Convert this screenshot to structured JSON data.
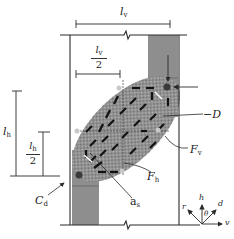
{
  "diagram": {
    "type": "beam-column joint free body / strut model",
    "labels": {
      "lv": {
        "main": "l",
        "sub": "v"
      },
      "lv_half": {
        "num_main": "l",
        "num_sub": "v",
        "den": "2"
      },
      "lh": {
        "main": "l",
        "sub": "h"
      },
      "lh_half": {
        "num_main": "l",
        "num_sub": "h",
        "den": "2"
      },
      "D": "−D",
      "Fv": {
        "main": "F",
        "sub": "v"
      },
      "Fh": {
        "main": "F",
        "sub": "h"
      },
      "Cd": {
        "main": "C",
        "sub": "d"
      },
      "as": {
        "main": "a",
        "sub": "s"
      }
    },
    "axes": {
      "h": "h",
      "r": "r",
      "d": "d",
      "v": "v",
      "theta": "θ"
    },
    "colors": {
      "line": "#2a2a2a",
      "column_fill": "#8c8c8c",
      "joint_fill": "#a8a8a8",
      "strut_dash": "#111111",
      "node": "#3a3a3a"
    }
  }
}
